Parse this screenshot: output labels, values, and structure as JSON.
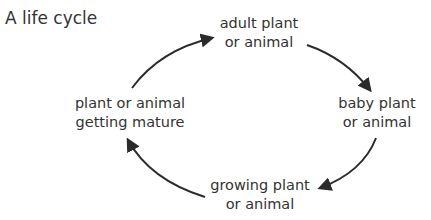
{
  "title": "A life cycle",
  "stages": [
    {
      "line1": "adult plant",
      "line2": "or animal"
    },
    {
      "line1": "baby plant",
      "line2": "or animal"
    },
    {
      "line1": "growing plant",
      "line2": "or animal"
    },
    {
      "line1": "plant or animal",
      "line2": "getting mature"
    }
  ],
  "arrows": [
    {
      "from": "adult plant or animal",
      "to": "baby plant or animal"
    },
    {
      "from": "baby plant or animal",
      "to": "growing plant or animal"
    },
    {
      "from": "growing plant or animal",
      "to": "plant or animal getting mature"
    },
    {
      "from": "plant or animal getting mature",
      "to": "adult plant or animal"
    }
  ],
  "colors": {
    "text": "#333333",
    "arrow": "#2b2b2b",
    "background": "#ffffff"
  }
}
